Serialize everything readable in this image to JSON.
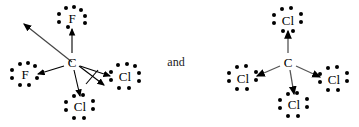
{
  "figure": {
    "type": "lewis-structure-dipole-diagram",
    "conjunction": "and",
    "ink_color": "#000000",
    "background_color": "#ffffff"
  },
  "structures": [
    {
      "id": "left",
      "name": "CF2Cl2",
      "center": {
        "label": "C",
        "x": 72,
        "y": 62
      },
      "substituents": [
        {
          "label": "F",
          "x": 72,
          "y": 18,
          "lone_pairs": 3,
          "bond_arrow": "to-substituent"
        },
        {
          "label": "F",
          "x": 25,
          "y": 74,
          "lone_pairs": 3,
          "bond_arrow": "to-substituent"
        },
        {
          "label": "Cl",
          "x": 125,
          "y": 76,
          "lone_pairs": 3,
          "bond_arrow": "to-substituent"
        },
        {
          "label": "Cl",
          "x": 80,
          "y": 106,
          "lone_pairs": 3,
          "bond_arrow": "to-substituent"
        }
      ],
      "net_dipole": {
        "from_x": 72,
        "from_y": 62,
        "to_x": 22,
        "to_y": 22,
        "label": ""
      },
      "cancelled_arrow": {
        "from_x": 72,
        "from_y": 62,
        "to_x": 104,
        "to_y": 85,
        "slashed": true
      }
    },
    {
      "id": "right",
      "name": "CCl4",
      "center": {
        "label": "C",
        "x": 288,
        "y": 62
      },
      "substituents": [
        {
          "label": "Cl",
          "x": 288,
          "y": 20,
          "lone_pairs": 3,
          "bond_arrow": "to-substituent"
        },
        {
          "label": "Cl",
          "x": 243,
          "y": 78,
          "lone_pairs": 3,
          "bond_arrow": "to-substituent"
        },
        {
          "label": "Cl",
          "x": 334,
          "y": 79,
          "lone_pairs": 3,
          "bond_arrow": "to-substituent"
        },
        {
          "label": "Cl",
          "x": 294,
          "y": 104,
          "lone_pairs": 3,
          "bond_arrow": "to-substituent"
        }
      ],
      "net_dipole": null,
      "cancelled_arrow": null
    }
  ],
  "labels": {
    "and_text": "and",
    "and_x": 176,
    "and_y": 62
  }
}
